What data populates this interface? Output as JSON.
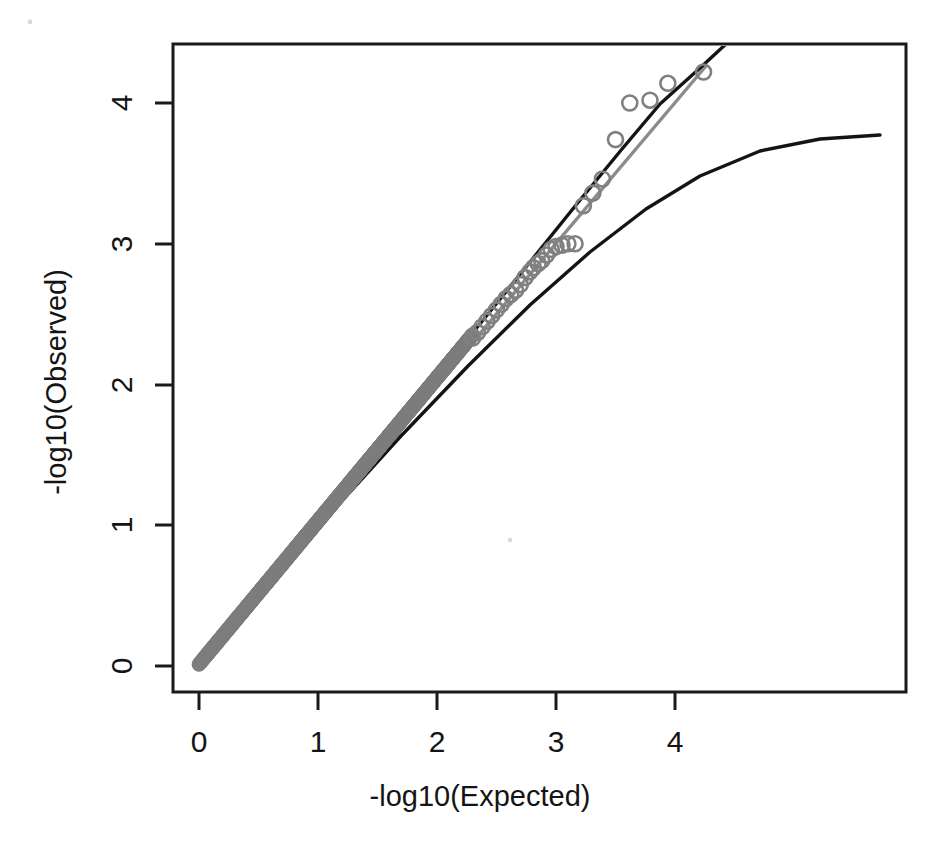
{
  "figure": {
    "background_color": "#ffffff",
    "point_color": "#808080",
    "identity_line_color": "#8c8c8c",
    "band_color": "#141414",
    "axis_color": "#1a1a1a"
  },
  "chart_data": {
    "type": "scatter",
    "title": "",
    "subtitle": "",
    "xlabel": "-log10(Expected)",
    "ylabel": "-log10(Observed)",
    "xlim": [
      -0.22,
      5.94
    ],
    "ylim": [
      -0.16,
      4.45
    ],
    "xticks": [
      0,
      1,
      2,
      3,
      4
    ],
    "xticklabels": [
      "0",
      "1",
      "2",
      "3",
      "4"
    ],
    "yticks": [
      0,
      1,
      2,
      3,
      4
    ],
    "yticklabels": [
      "0",
      "1",
      "2",
      "3",
      "4"
    ],
    "grid": false,
    "legend": null,
    "annotations": [],
    "series": [
      {
        "name": "observed-vs-expected",
        "marker": "open-circle",
        "color": "#808080",
        "points_tail": [
          [
            4.24,
            4.22
          ],
          [
            3.94,
            4.14
          ],
          [
            3.79,
            4.02
          ],
          [
            3.62,
            4.0
          ],
          [
            3.5,
            3.74
          ],
          [
            3.39,
            3.46
          ],
          [
            3.31,
            3.36
          ],
          [
            3.23,
            3.27
          ],
          [
            3.16,
            3.0
          ],
          [
            3.1,
            3.0
          ],
          [
            3.05,
            2.99
          ],
          [
            3.0,
            2.98
          ],
          [
            2.96,
            2.96
          ],
          [
            2.92,
            2.92
          ],
          [
            2.88,
            2.88
          ],
          [
            2.85,
            2.86
          ],
          [
            2.81,
            2.83
          ],
          [
            2.78,
            2.8
          ],
          [
            2.74,
            2.76
          ],
          [
            2.7,
            2.71
          ],
          [
            2.66,
            2.67
          ],
          [
            2.62,
            2.64
          ],
          [
            2.58,
            2.61
          ],
          [
            2.54,
            2.57
          ],
          [
            2.5,
            2.53
          ],
          [
            2.46,
            2.49
          ],
          [
            2.42,
            2.45
          ],
          [
            2.38,
            2.41
          ],
          [
            2.34,
            2.37
          ],
          [
            2.3,
            2.33
          ]
        ],
        "dense_band_note": "continuous dense band of open circles from (0,0) to about (2.3,2.33) lying slightly above the identity line"
      },
      {
        "name": "identity-line",
        "type": "line",
        "color": "#8c8c8c",
        "from": [
          0.0,
          0.0
        ],
        "to": [
          4.26,
          4.26
        ]
      },
      {
        "name": "upper-confidence-curve",
        "type": "line",
        "color": "#141414",
        "from": [
          0.0,
          0.0
        ],
        "to": [
          3.18,
          4.6
        ]
      },
      {
        "name": "lower-confidence-curve",
        "type": "line",
        "color": "#141414",
        "from": [
          0.0,
          0.0
        ],
        "to": [
          5.72,
          3.76
        ]
      }
    ]
  }
}
